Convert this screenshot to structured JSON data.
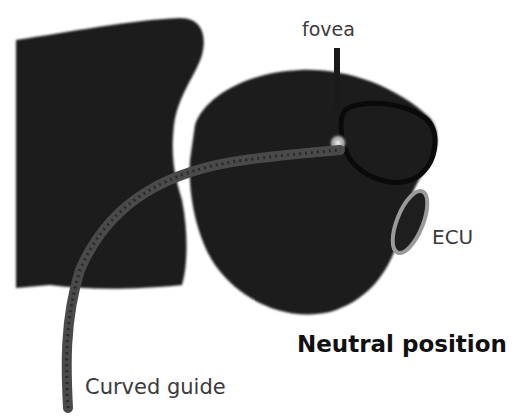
{
  "figure": {
    "title": "Neutral position",
    "labels": {
      "fovea": "fovea",
      "ecu": "ECU",
      "curved_guide": "Curved guide"
    },
    "colors": {
      "bone": "#1e1e1e",
      "guide": "#4a4a4a",
      "ecu_ring": "#9a9a9a",
      "fovea_spot": "#e8e8e8",
      "text": "#3a3a3a",
      "title_text": "#111111"
    }
  }
}
